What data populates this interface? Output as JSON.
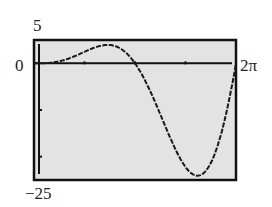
{
  "chart_data": {
    "type": "line",
    "title": "",
    "function_hint": "y = x^2 sin(x)",
    "xlabel": "",
    "ylabel": "",
    "xlim": [
      0,
      6.2832
    ],
    "ylim": [
      -25,
      5
    ],
    "tick_labels": {
      "ymax": "5",
      "yzero": "0",
      "xmax": "2π",
      "ymin": "−25"
    },
    "grid": false,
    "legend": null,
    "series": [
      {
        "name": "curve",
        "x": [
          0,
          0.5,
          1.0,
          1.5,
          2.0,
          2.5,
          3.0,
          3.1416,
          3.5,
          4.0,
          4.5,
          4.9,
          5.2,
          5.5,
          5.8,
          6.2832
        ],
        "y": [
          0,
          0.12,
          0.84,
          2.24,
          3.64,
          3.74,
          1.27,
          0,
          -4.3,
          -12.11,
          -19.79,
          -23.55,
          -23.69,
          -21.46,
          -15.43,
          0
        ]
      }
    ]
  },
  "colors": {
    "plot_bg": "#e3e3e3",
    "frame": "#111111",
    "curve": "#1a1a1a"
  }
}
